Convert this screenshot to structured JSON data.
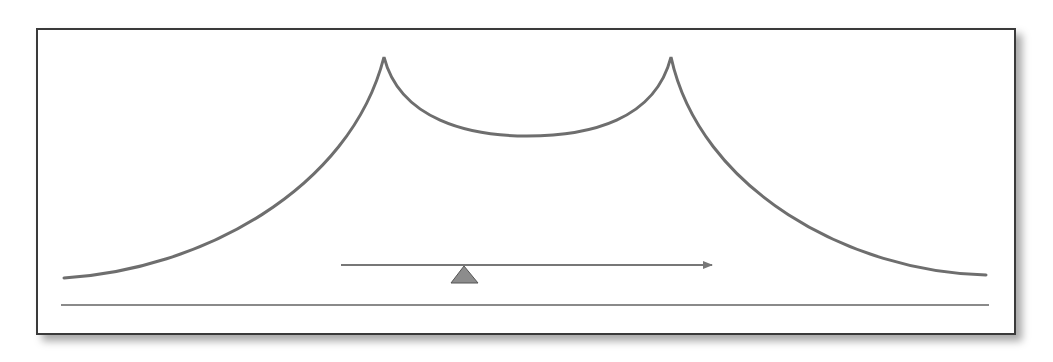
{
  "diagram": {
    "type": "line-drawing",
    "colors": {
      "frame_border": "#3a3a3a",
      "curve": "#6e6e6e",
      "arrow": "#777777",
      "baseline": "#8a8a8a",
      "marker_fill": "#8c8c8c",
      "marker_stroke": "#555555"
    },
    "elements": {
      "curve": {
        "left_start": [
          64,
          278
        ],
        "peak_left": [
          384,
          57
        ],
        "valley": [
          527,
          136
        ],
        "peak_right": [
          671,
          57
        ],
        "right_end": [
          986,
          275
        ]
      },
      "baseline": {
        "x1": 61,
        "x2": 989,
        "y": 305
      },
      "arrow": {
        "x1": 341,
        "x2": 714,
        "y": 265,
        "direction": "right"
      },
      "marker": {
        "shape": "triangle",
        "apex": [
          464,
          265
        ],
        "base_left": [
          451,
          283
        ],
        "base_right": [
          478,
          283
        ]
      }
    }
  }
}
